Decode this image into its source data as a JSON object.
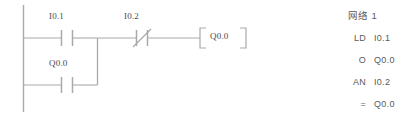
{
  "canvas": {
    "width": 418,
    "height": 120,
    "background": "#ffffff",
    "line_color": "#a9a9a9",
    "text_color": "#4a4a4a"
  },
  "ladder": {
    "title": "ladder-logic-network",
    "rungs": [
      {
        "index": 0,
        "elements": [
          {
            "type": "contact-no",
            "label": "I0.1"
          },
          {
            "type": "contact-nc",
            "label": "I0.2"
          },
          {
            "type": "coil-output",
            "label": "Q0.0"
          }
        ]
      },
      {
        "index": 1,
        "branch": true,
        "elements": [
          {
            "type": "contact-no",
            "label": "Q0.0"
          }
        ]
      }
    ],
    "labels": {
      "contact_1": "I0.1",
      "contact_2": "I0.2",
      "contact_3": "Q0.0",
      "coil": "Q0.0"
    }
  },
  "stl": {
    "heading": "网络 1",
    "instructions": [
      {
        "operator": "LD",
        "operand": "I0.1"
      },
      {
        "operator": "O",
        "operand": "Q0.0"
      },
      {
        "operator": "AN",
        "operand": "I0.2"
      },
      {
        "operator": "=",
        "operand": "Q0.0"
      }
    ]
  }
}
